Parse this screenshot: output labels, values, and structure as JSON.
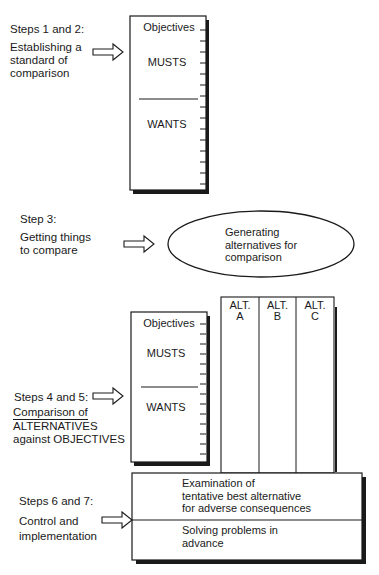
{
  "section1": {
    "step": "Steps 1 and 2:",
    "desc": [
      "Establishing a",
      "standard of",
      "comparison"
    ],
    "box": {
      "header": "Objectives",
      "musts": "MUSTS",
      "wants": "WANTS"
    }
  },
  "section2": {
    "step": "Step 3:",
    "desc": [
      "Getting things",
      "to compare"
    ],
    "ellipse": [
      "Generating",
      "alternatives for",
      "comparison"
    ]
  },
  "section3": {
    "step": "Steps 4 and 5:",
    "desc": [
      "Comparison of",
      "ALTERNATIVES",
      "against OBJECTIVES"
    ],
    "box": {
      "header": "Objectives",
      "musts": "MUSTS",
      "wants": "WANTS"
    },
    "alternatives": [
      {
        "line1": "ALT.",
        "line2": "A"
      },
      {
        "line1": "ALT.",
        "line2": "B"
      },
      {
        "line1": "ALT.",
        "line2": "C"
      }
    ]
  },
  "section4": {
    "step": "Steps 6 and 7:",
    "desc": [
      "Control and",
      "implementation"
    ],
    "top": [
      "Examination of",
      "tentative best alternative",
      "for adverse consequences"
    ],
    "bottom": [
      "Solving problems in",
      "advance"
    ]
  }
}
